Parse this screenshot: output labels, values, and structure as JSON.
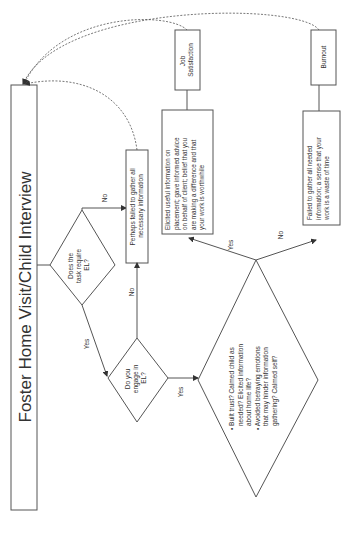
{
  "title": "Foster Home Visit/Child Interview",
  "nodes": {
    "decision_task": {
      "lines": [
        "Does the",
        "task require",
        "EL?"
      ]
    },
    "failed_gather": {
      "lines": [
        "Perhaps failed to gather all",
        "necessary information"
      ]
    },
    "decision_engage": {
      "lines": [
        "Do you",
        "engage in",
        "EL?"
      ]
    },
    "decision_outcome": {
      "bullets": [
        [
          "Built trust? Calmed child as",
          "needed? Elicited information",
          "about home life?"
        ],
        [
          "Avoided betraying emotions",
          "that may hinder information",
          "gathering? Calmed self?"
        ]
      ]
    },
    "elicited": {
      "lines": [
        "Elicited useful information on",
        "placement; gave informed advice",
        "on behalf of client; belief that you",
        "are making a difference and that",
        "your work is worthwhile"
      ]
    },
    "failed_all": {
      "lines": [
        "Failed to gather all needed",
        "information; a sense that your",
        "work is a waste of time"
      ]
    },
    "job_satisfaction": {
      "lines": [
        "Job",
        "Satisfaction"
      ]
    },
    "burnout": {
      "lines": [
        "Burnout"
      ]
    }
  },
  "edge_labels": {
    "task_no": "No",
    "task_yes": "Yes",
    "engage_no": "No",
    "engage_yes": "Yes",
    "outcome_yes": "Yes",
    "outcome_no": "No"
  },
  "colors": {
    "stroke": "#555555",
    "text": "#333333",
    "background": "#ffffff"
  }
}
